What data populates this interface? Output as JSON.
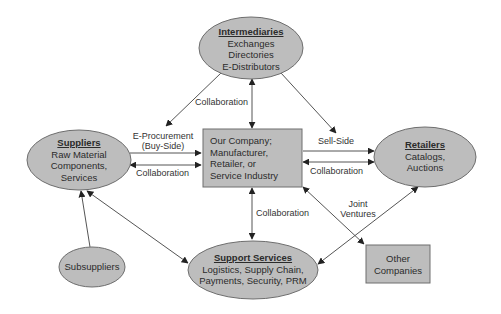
{
  "colors": {
    "node_fill": "#bdbdbd",
    "node_stroke": "#6e6e6e",
    "edge": "#555555",
    "background": "#ffffff"
  },
  "nodes": {
    "intermediaries": {
      "title": "Intermediaries",
      "lines": [
        "Exchanges",
        "Directories",
        "E-Distributors"
      ],
      "shape": "ellipse"
    },
    "suppliers": {
      "title": "Suppliers",
      "lines": [
        "Raw Material",
        "Components,",
        "Services"
      ],
      "shape": "ellipse"
    },
    "our_company": {
      "lines": [
        "Our Company;",
        "Manufacturer,",
        "Retailer, or",
        "Service Industry"
      ],
      "shape": "rectangle"
    },
    "retailers": {
      "title": "Retailers",
      "lines": [
        "Catalogs,",
        "Auctions"
      ],
      "shape": "ellipse"
    },
    "support_services": {
      "title": "Support Services",
      "lines": [
        "Logistics, Supply Chain,",
        "Payments, Security, PRM"
      ],
      "shape": "ellipse"
    },
    "subsuppliers": {
      "lines": [
        "Subsuppliers"
      ],
      "shape": "ellipse"
    },
    "other_companies": {
      "lines": [
        "Other",
        "Companies"
      ],
      "shape": "rectangle"
    }
  },
  "edges": [
    {
      "from": "intermediaries",
      "to": "suppliers",
      "label": "Collaboration",
      "direction": "forward"
    },
    {
      "from": "intermediaries",
      "to": "our_company",
      "label": "",
      "direction": "both"
    },
    {
      "from": "intermediaries",
      "to": "retailers",
      "label": "Sell-Side",
      "direction": "forward"
    },
    {
      "from": "suppliers",
      "to": "our_company",
      "label": "E-Procurement (Buy-Side)",
      "direction": "forward"
    },
    {
      "from": "our_company",
      "to": "suppliers",
      "label": "Collaboration",
      "direction": "both"
    },
    {
      "from": "our_company",
      "to": "retailers",
      "label": "",
      "direction": "forward"
    },
    {
      "from": "retailers",
      "to": "our_company",
      "label": "Collaboration",
      "direction": "both"
    },
    {
      "from": "our_company",
      "to": "support_services",
      "label": "Collaboration",
      "direction": "both"
    },
    {
      "from": "our_company",
      "to": "other_companies",
      "label": "Joint Ventures",
      "direction": "both"
    },
    {
      "from": "support_services",
      "to": "retailers",
      "label": "",
      "direction": "both"
    },
    {
      "from": "suppliers",
      "to": "support_services",
      "label": "",
      "direction": "both"
    },
    {
      "from": "subsuppliers",
      "to": "suppliers",
      "label": "",
      "direction": "forward"
    }
  ],
  "edge_labels": {
    "collab_intermediaries": "Collaboration",
    "eproc_line1": "E-Procurement",
    "eproc_line2": "(Buy-Side)",
    "collab_suppliers": "Collaboration",
    "sell_side": "Sell-Side",
    "collab_retailers": "Collaboration",
    "collab_support": "Collaboration",
    "joint_line1": "Joint",
    "joint_line2": "Ventures"
  }
}
